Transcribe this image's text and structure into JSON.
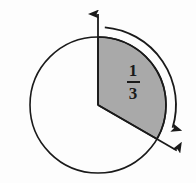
{
  "figure": {
    "type": "geometry-diagram",
    "background_color": "#fdfdfd",
    "circle": {
      "center_x": 98,
      "center_y": 105,
      "radius": 68,
      "stroke_color": "#1a1a1a",
      "stroke_width": 1.6,
      "fill": "none"
    },
    "sector": {
      "label_numerator": "1",
      "label_denominator": "3",
      "fraction_text": "1/3",
      "fill_color": "#a9a9a9",
      "stroke_color": "#1a1a1a",
      "start_angle_deg": 0,
      "end_angle_deg": 120,
      "start_angle_label": "12 o'clock",
      "direction": "clockwise"
    },
    "rays": [
      {
        "name": "initial-side-ray",
        "direction": "up",
        "angle_deg": 0,
        "has_arrowhead": true,
        "color": "#1a1a1a"
      },
      {
        "name": "terminal-side-ray",
        "direction": "down-right",
        "angle_deg": 120,
        "has_arrowhead": true,
        "color": "#1a1a1a"
      }
    ],
    "rotation_arc": {
      "name": "rotation-arrow",
      "direction": "clockwise",
      "has_arrowhead": true,
      "color": "#1a1a1a",
      "radius": 78
    },
    "bleed_through": {
      "top_text": "",
      "bottom_text": ""
    }
  }
}
